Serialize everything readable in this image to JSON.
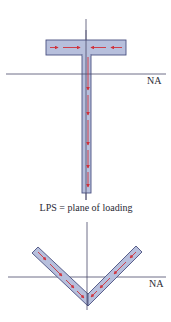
{
  "diagram": {
    "top_figure": {
      "shape": "T-section",
      "axis_label": "NA",
      "flow_arrows": "shear flow toward web in flange, downward in web"
    },
    "caption": "LPS = plane of loading",
    "bottom_figure": {
      "shape": "V-angle section",
      "axis_label": "NA",
      "flow_arrows": "shear flow along legs toward apex"
    },
    "colors": {
      "section_fill": "#b7bfdc",
      "section_stroke": "#4a5080",
      "arrow": "#d0303a",
      "axis": "#4a4a6a",
      "text": "#2a2a35"
    }
  }
}
